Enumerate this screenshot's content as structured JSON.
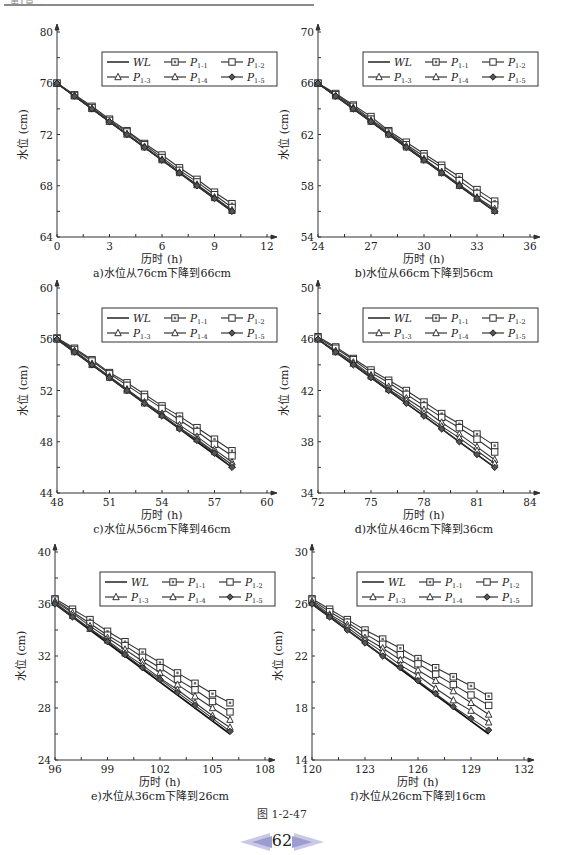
{
  "header": {
    "text": "第1章 ..."
  },
  "figure": {
    "label": "图 1-2-47",
    "page_number": "62"
  },
  "legend": {
    "entries": [
      {
        "key": "WL",
        "marker": "none",
        "label": "WL",
        "sub": ""
      },
      {
        "key": "P11",
        "marker": "square",
        "label": "P",
        "sub": "1-1"
      },
      {
        "key": "P12",
        "marker": "square-open",
        "label": "P",
        "sub": "1-2"
      },
      {
        "key": "P13",
        "marker": "triangle",
        "label": "P",
        "sub": "1-3"
      },
      {
        "key": "P14",
        "marker": "triangle-open",
        "label": "P",
        "sub": "1-4"
      },
      {
        "key": "P15",
        "marker": "diamond",
        "label": "P",
        "sub": "1-5"
      }
    ]
  },
  "chart_data": [
    {
      "id": "a",
      "type": "line",
      "title": "a)水位从76cm下降到66cm",
      "xlabel": "历时 (h)",
      "ylabel": "水位 (cm)",
      "xlim": [
        0,
        12
      ],
      "ylim": [
        64,
        80
      ],
      "xticks": [
        0,
        3,
        6,
        9,
        12
      ],
      "yticks": [
        64,
        68,
        72,
        76,
        80
      ],
      "x": [
        0,
        1,
        2,
        3,
        4,
        5,
        6,
        7,
        8,
        9,
        10
      ],
      "series": [
        {
          "name": "WL",
          "values": [
            76,
            75,
            74,
            73,
            72,
            71,
            70,
            69,
            68,
            67,
            66
          ]
        },
        {
          "name": "P1-1",
          "values": [
            76,
            75.1,
            74.2,
            73.2,
            72.3,
            71.3,
            70.4,
            69.4,
            68.5,
            67.5,
            66.6
          ]
        },
        {
          "name": "P1-2",
          "values": [
            76,
            75.05,
            74.1,
            73.1,
            72.2,
            71.2,
            70.2,
            69.2,
            68.3,
            67.3,
            66.3
          ]
        },
        {
          "name": "P1-3",
          "values": [
            76,
            75,
            74,
            73,
            72.05,
            71.05,
            70.05,
            69.05,
            68.1,
            67.1,
            66.1
          ]
        },
        {
          "name": "P1-4",
          "values": [
            76,
            75,
            74,
            73,
            72,
            71,
            70,
            69,
            68.05,
            67.05,
            66.05
          ]
        },
        {
          "name": "P1-5",
          "values": [
            76,
            75,
            74,
            73,
            72,
            71,
            70,
            69,
            68,
            67,
            66
          ]
        }
      ],
      "legend_position": "upper right",
      "grid": false
    },
    {
      "id": "b",
      "type": "line",
      "title": "b)水位从66cm下降到56cm",
      "xlabel": "历时 (h)",
      "ylabel": "水位 (cm)",
      "xlim": [
        24,
        36
      ],
      "ylim": [
        54,
        70
      ],
      "xticks": [
        24,
        27,
        30,
        33,
        36
      ],
      "yticks": [
        54,
        58,
        62,
        66,
        70
      ],
      "x": [
        24,
        25,
        26,
        27,
        28,
        29,
        30,
        31,
        32,
        33,
        34
      ],
      "series": [
        {
          "name": "WL",
          "values": [
            66,
            65,
            64,
            63,
            62,
            61,
            60,
            59,
            58,
            57,
            56
          ]
        },
        {
          "name": "P1-1",
          "values": [
            66,
            65.2,
            64.3,
            63.4,
            62.3,
            61.4,
            60.5,
            59.6,
            58.7,
            57.7,
            56.8
          ]
        },
        {
          "name": "P1-2",
          "values": [
            66,
            65.1,
            64.2,
            63.2,
            62.2,
            61.2,
            60.3,
            59.4,
            58.4,
            57.4,
            56.5
          ]
        },
        {
          "name": "P1-3",
          "values": [
            66,
            65,
            64.1,
            63.1,
            62.1,
            61.1,
            60.1,
            59.1,
            58.1,
            57.1,
            56.2
          ]
        },
        {
          "name": "P1-4",
          "values": [
            66,
            65,
            64,
            63,
            62,
            61,
            60,
            59,
            58,
            57,
            56.05
          ]
        },
        {
          "name": "P1-5",
          "values": [
            66,
            65,
            64,
            63,
            62,
            61,
            60,
            59,
            58,
            57,
            56
          ]
        }
      ],
      "legend_position": "upper right",
      "grid": false
    },
    {
      "id": "c",
      "type": "line",
      "title": "c)水位从56cm下降到46cm",
      "xlabel": "历时 (h)",
      "ylabel": "水位 (cm)",
      "xlim": [
        48,
        60
      ],
      "ylim": [
        44,
        60
      ],
      "xticks": [
        48,
        51,
        54,
        57,
        60
      ],
      "yticks": [
        44,
        48,
        52,
        56,
        60
      ],
      "x": [
        48,
        49,
        50,
        51,
        52,
        53,
        54,
        55,
        56,
        57,
        58
      ],
      "series": [
        {
          "name": "WL",
          "values": [
            56,
            55,
            54,
            53,
            52,
            51,
            50,
            49,
            48,
            47,
            46
          ]
        },
        {
          "name": "P1-1",
          "values": [
            56.1,
            55.3,
            54.4,
            53.4,
            52.6,
            51.7,
            50.8,
            50,
            49.1,
            48.2,
            47.3
          ]
        },
        {
          "name": "P1-2",
          "values": [
            56.05,
            55.2,
            54.3,
            53.3,
            52.4,
            51.5,
            50.6,
            49.7,
            48.8,
            47.8,
            46.9
          ]
        },
        {
          "name": "P1-3",
          "values": [
            56,
            55.1,
            54.1,
            53.1,
            52.1,
            51.1,
            50.2,
            49.3,
            48.4,
            47.4,
            46.4
          ]
        },
        {
          "name": "P1-4",
          "values": [
            56,
            55,
            54,
            53,
            52,
            51,
            50.1,
            49.1,
            48.2,
            47.2,
            46.2
          ]
        },
        {
          "name": "P1-5",
          "values": [
            56,
            55,
            54,
            53,
            52,
            51,
            50,
            49,
            48.1,
            47.1,
            46
          ]
        }
      ],
      "legend_position": "upper right",
      "grid": false
    },
    {
      "id": "d",
      "type": "line",
      "title": "d)水位从46cm下降到36cm",
      "xlabel": "历时 (h)",
      "ylabel": "水位 (cm)",
      "xlim": [
        72,
        84
      ],
      "ylim": [
        34,
        50
      ],
      "xticks": [
        72,
        75,
        78,
        81,
        84
      ],
      "yticks": [
        34,
        38,
        42,
        46,
        50
      ],
      "x": [
        72,
        73,
        74,
        75,
        76,
        77,
        78,
        79,
        80,
        81,
        82
      ],
      "series": [
        {
          "name": "WL",
          "values": [
            46,
            45,
            44,
            43,
            42,
            41,
            40,
            39,
            38,
            37,
            36
          ]
        },
        {
          "name": "P1-1",
          "values": [
            46.2,
            45.4,
            44.5,
            43.6,
            42.8,
            42,
            41.1,
            40.2,
            39.4,
            38.6,
            37.7
          ]
        },
        {
          "name": "P1-2",
          "values": [
            46.1,
            45.3,
            44.4,
            43.4,
            42.6,
            41.7,
            40.8,
            39.9,
            39.1,
            38.2,
            37.2
          ]
        },
        {
          "name": "P1-3",
          "values": [
            46,
            45.1,
            44.2,
            43.2,
            42.3,
            41.4,
            40.5,
            39.5,
            38.6,
            37.6,
            36.6
          ]
        },
        {
          "name": "P1-4",
          "values": [
            46,
            45,
            44.1,
            43.1,
            42.1,
            41.2,
            40.2,
            39.2,
            38.3,
            37.3,
            36.3
          ]
        },
        {
          "name": "P1-5",
          "values": [
            46,
            45,
            44,
            43,
            42,
            41,
            40,
            39,
            38,
            37,
            36
          ]
        }
      ],
      "legend_position": "upper right",
      "grid": false
    },
    {
      "id": "e",
      "type": "line",
      "title": "e)水位从36cm下降到26cm",
      "xlabel": "历时 (h)",
      "ylabel": "水位 (cm)",
      "xlim": [
        96,
        108
      ],
      "ylim": [
        24,
        40
      ],
      "xticks": [
        96,
        99,
        102,
        105,
        108
      ],
      "yticks": [
        24,
        28,
        32,
        36,
        40
      ],
      "x": [
        96,
        97,
        98,
        99,
        100,
        101,
        102,
        103,
        104,
        105,
        106
      ],
      "series": [
        {
          "name": "WL",
          "values": [
            36,
            35,
            34,
            33,
            32,
            31,
            30,
            29,
            28,
            27,
            26
          ]
        },
        {
          "name": "P1-1",
          "values": [
            36.4,
            35.6,
            34.8,
            33.9,
            33.1,
            32.3,
            31.5,
            30.7,
            29.9,
            29.1,
            28.4
          ]
        },
        {
          "name": "P1-2",
          "values": [
            36.3,
            35.4,
            34.5,
            33.6,
            32.8,
            31.9,
            31.1,
            30.2,
            29.4,
            28.5,
            27.7
          ]
        },
        {
          "name": "P1-3",
          "values": [
            36.2,
            35.3,
            34.3,
            33.4,
            32.5,
            31.6,
            30.7,
            29.8,
            28.9,
            28,
            27.1
          ]
        },
        {
          "name": "P1-4",
          "values": [
            36.1,
            35.1,
            34.1,
            33.2,
            32.2,
            31.3,
            30.3,
            29.4,
            28.4,
            27.4,
            26.5
          ]
        },
        {
          "name": "P1-5",
          "values": [
            36,
            35,
            34.1,
            33.1,
            32.1,
            31.1,
            30.2,
            29.2,
            28.2,
            27.2,
            26.2
          ]
        }
      ],
      "legend_position": "upper right",
      "grid": false
    },
    {
      "id": "f",
      "type": "line",
      "title": "f)水位从26cm下降到16cm",
      "xlabel": "历时 (h)",
      "ylabel": "水位 (cm)",
      "xlim": [
        120,
        132
      ],
      "ylim": [
        14,
        30
      ],
      "xticks": [
        120,
        123,
        126,
        129,
        132
      ],
      "yticks": [
        14,
        18,
        22,
        26,
        30
      ],
      "x": [
        120,
        121,
        122,
        123,
        124,
        125,
        126,
        127,
        128,
        129,
        130
      ],
      "series": [
        {
          "name": "WL",
          "values": [
            26,
            25,
            24,
            23,
            22,
            21,
            20,
            19,
            18,
            17,
            16
          ]
        },
        {
          "name": "P1-1",
          "values": [
            26.4,
            25.6,
            24.8,
            24,
            23.3,
            22.6,
            21.8,
            21.1,
            20.4,
            19.7,
            18.9
          ]
        },
        {
          "name": "P1-2",
          "values": [
            26.3,
            25.4,
            24.6,
            23.7,
            22.9,
            22.1,
            21.4,
            20.6,
            19.8,
            19,
            18.2
          ]
        },
        {
          "name": "P1-3",
          "values": [
            26.2,
            25.2,
            24.4,
            23.4,
            22.6,
            21.7,
            20.9,
            20.1,
            19.3,
            18.4,
            17.5
          ]
        },
        {
          "name": "P1-4",
          "values": [
            26.1,
            25.1,
            24.2,
            23.2,
            22.3,
            21.3,
            20.5,
            19.5,
            18.6,
            17.8,
            16.9
          ]
        },
        {
          "name": "P1-5",
          "values": [
            26,
            25,
            24,
            23,
            22,
            21.1,
            20.1,
            19.1,
            18.1,
            17.2,
            16.3
          ]
        }
      ],
      "legend_position": "upper right",
      "grid": false
    }
  ]
}
